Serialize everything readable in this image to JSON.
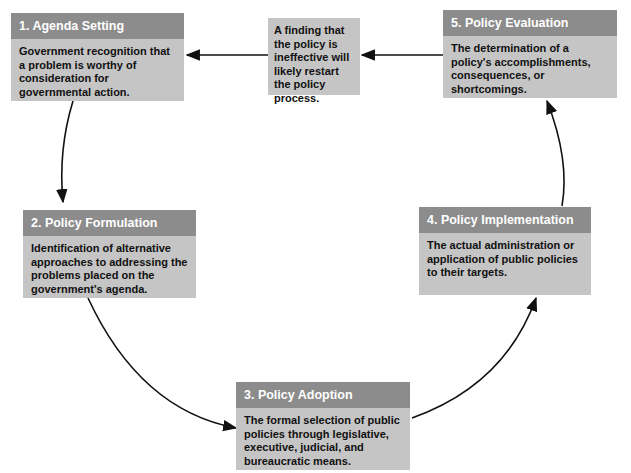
{
  "diagram": {
    "colors": {
      "header": "#8c8c8c",
      "body": "#c5c5c5",
      "arrow": "#111111"
    },
    "stages": [
      {
        "label": "1. Agenda Setting",
        "description": "Government recognition that a problem is worthy of consideration for governmental action."
      },
      {
        "label": "2. Policy Formulation",
        "description": "Identification of alternative approaches to addressing the problems placed on the government's agenda."
      },
      {
        "label": "3. Policy Adoption",
        "description": "The formal selection of public policies through legislative, executive, judicial, and bureaucratic means."
      },
      {
        "label": "4. Policy Implementation",
        "description": "The actual administration or application of public policies to their targets."
      },
      {
        "label": "5. Policy Evaluation",
        "description": "The determination of a policy's accomplishments, consequences, or shortcomings."
      }
    ],
    "feedback_note": "A finding that the policy is ineffective will likely restart the policy process.",
    "edges": [
      {
        "from": "1. Agenda Setting",
        "to": "2. Policy Formulation"
      },
      {
        "from": "2. Policy Formulation",
        "to": "3. Policy Adoption"
      },
      {
        "from": "3. Policy Adoption",
        "to": "4. Policy Implementation"
      },
      {
        "from": "4. Policy Implementation",
        "to": "5. Policy Evaluation"
      },
      {
        "from": "5. Policy Evaluation",
        "to": "feedback note"
      },
      {
        "from": "feedback note",
        "to": "1. Agenda Setting"
      }
    ]
  }
}
